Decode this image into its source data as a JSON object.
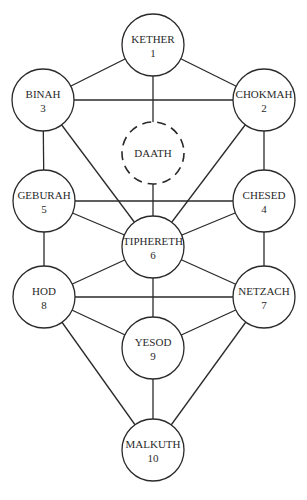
{
  "nodes": [
    {
      "id": "kether",
      "name": "KETHER",
      "number": "1"
    },
    {
      "id": "chokmah",
      "name": "CHOKMAH",
      "number": "2"
    },
    {
      "id": "binah",
      "name": "BINAH",
      "number": "3"
    },
    {
      "id": "daath",
      "name": "DAATH",
      "number": "",
      "hidden": true
    },
    {
      "id": "chesed",
      "name": "CHESED",
      "number": "4"
    },
    {
      "id": "geburah",
      "name": "GEBURAH",
      "number": "5"
    },
    {
      "id": "tiphereth",
      "name": "TIPHERETH",
      "number": "6"
    },
    {
      "id": "netzach",
      "name": "NETZACH",
      "number": "7"
    },
    {
      "id": "hod",
      "name": "HOD",
      "number": "8"
    },
    {
      "id": "yesod",
      "name": "YESOD",
      "number": "9"
    },
    {
      "id": "malkuth",
      "name": "MALKUTH",
      "number": "10"
    }
  ],
  "paths": [
    [
      "kether",
      "binah"
    ],
    [
      "kether",
      "chokmah"
    ],
    [
      "kether",
      "tiphereth"
    ],
    [
      "binah",
      "chokmah"
    ],
    [
      "binah",
      "geburah"
    ],
    [
      "binah",
      "tiphereth"
    ],
    [
      "chokmah",
      "chesed"
    ],
    [
      "chokmah",
      "tiphereth"
    ],
    [
      "geburah",
      "chesed"
    ],
    [
      "geburah",
      "tiphereth"
    ],
    [
      "geburah",
      "hod"
    ],
    [
      "chesed",
      "tiphereth"
    ],
    [
      "chesed",
      "netzach"
    ],
    [
      "tiphereth",
      "hod"
    ],
    [
      "tiphereth",
      "netzach"
    ],
    [
      "tiphereth",
      "yesod"
    ],
    [
      "hod",
      "netzach"
    ],
    [
      "hod",
      "yesod"
    ],
    [
      "hod",
      "malkuth"
    ],
    [
      "netzach",
      "yesod"
    ],
    [
      "netzach",
      "malkuth"
    ],
    [
      "yesod",
      "malkuth"
    ]
  ]
}
